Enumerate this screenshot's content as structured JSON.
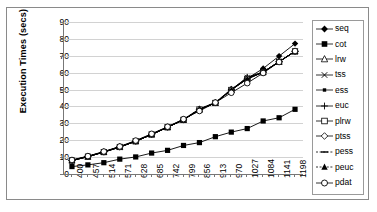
{
  "chart": {
    "ylabel": "Execution Times (secs)",
    "xlabel": "",
    "title": ""
  },
  "axis": {
    "y_ticks": [
      "90",
      "80",
      "70",
      "60",
      "50",
      "40",
      "30",
      "20",
      "10",
      "0"
    ],
    "x_ticks": [
      "400",
      "457",
      "514",
      "571",
      "628",
      "685",
      "742",
      "799",
      "856",
      "913",
      "970",
      "1027",
      "1084",
      "1141",
      "1198"
    ]
  },
  "legend": {
    "items": [
      {
        "label": "seq",
        "marker": "filled-diamond",
        "color": "#000000"
      },
      {
        "label": "cot",
        "marker": "filled-square",
        "color": "#000000"
      },
      {
        "label": "lrw",
        "marker": "open-triangle",
        "color": "#000000"
      },
      {
        "label": "tss",
        "marker": "cross-x",
        "color": "#000000"
      },
      {
        "label": "ess",
        "marker": "small-filled-square",
        "color": "#000000"
      },
      {
        "label": "euc",
        "marker": "plus",
        "color": "#000000"
      },
      {
        "label": "plrw",
        "marker": "open-square",
        "color": "#000000"
      },
      {
        "label": "ptss",
        "marker": "open-diamond",
        "color": "#000000"
      },
      {
        "label": "pess",
        "marker": "dash",
        "color": "#000000"
      },
      {
        "label": "peuc",
        "marker": "filled-triangle",
        "color": "#000000"
      },
      {
        "label": "pdat",
        "marker": "open-circle",
        "color": "#000000"
      }
    ]
  },
  "chart_data": {
    "type": "line",
    "title": "",
    "xlabel": "",
    "ylabel": "Execution Times (secs)",
    "ylim": [
      0,
      90
    ],
    "grid": true,
    "legend_position": "right",
    "categories": [
      "400",
      "457",
      "514",
      "571",
      "628",
      "685",
      "742",
      "799",
      "856",
      "913",
      "970",
      "1027",
      "1084",
      "1141",
      "1198"
    ],
    "series": [
      {
        "name": "seq",
        "marker": "filled-diamond",
        "values": [
          8.2,
          10.5,
          13.2,
          16.2,
          19.6,
          23.6,
          27.9,
          32.4,
          38.6,
          42.4,
          50.3,
          56.5,
          62.5,
          69.8,
          77.2
        ]
      },
      {
        "name": "cot",
        "marker": "filled-square",
        "values": [
          4.4,
          5.4,
          6.7,
          8.8,
          10.1,
          12.4,
          14.0,
          16.9,
          18.6,
          22.1,
          24.8,
          26.9,
          31.4,
          33.3,
          38.3
        ]
      },
      {
        "name": "lrw",
        "marker": "open-triangle",
        "values": [
          8.0,
          10.3,
          13.0,
          16.0,
          19.4,
          23.4,
          27.7,
          32.1,
          38.2,
          42.1,
          49.8,
          56.9,
          60.3,
          66.5,
          72.6
        ]
      },
      {
        "name": "tss",
        "marker": "cross-x",
        "values": [
          8.0,
          10.3,
          13.0,
          16.0,
          19.4,
          23.4,
          27.7,
          32.1,
          38.2,
          42.1,
          49.8,
          57.2,
          60.3,
          66.5,
          72.6
        ]
      },
      {
        "name": "ess",
        "marker": "small-filled-square",
        "values": [
          8.0,
          10.3,
          13.0,
          16.0,
          19.4,
          23.4,
          27.7,
          32.1,
          38.2,
          42.1,
          49.8,
          56.6,
          60.3,
          66.5,
          72.6
        ]
      },
      {
        "name": "euc",
        "marker": "plus",
        "values": [
          8.0,
          10.3,
          13.0,
          16.0,
          19.4,
          23.4,
          27.7,
          32.1,
          38.2,
          42.1,
          49.8,
          57.4,
          60.3,
          66.5,
          72.6
        ]
      },
      {
        "name": "plrw",
        "marker": "open-square",
        "values": [
          8.0,
          10.3,
          13.0,
          16.0,
          19.4,
          23.4,
          27.7,
          32.1,
          38.2,
          42.1,
          49.8,
          56.3,
          60.3,
          66.5,
          72.6
        ]
      },
      {
        "name": "ptss",
        "marker": "open-diamond",
        "values": [
          8.0,
          10.3,
          13.0,
          16.0,
          19.4,
          23.4,
          27.7,
          32.1,
          38.2,
          42.1,
          49.8,
          56.3,
          60.3,
          66.5,
          72.6
        ]
      },
      {
        "name": "pess",
        "marker": "dash",
        "values": [
          8.0,
          10.3,
          13.0,
          16.0,
          19.4,
          23.4,
          27.7,
          32.1,
          38.2,
          42.1,
          49.8,
          56.3,
          60.3,
          66.5,
          72.6
        ]
      },
      {
        "name": "peuc",
        "marker": "filled-triangle",
        "values": [
          8.0,
          10.3,
          13.0,
          16.0,
          19.4,
          23.4,
          27.7,
          32.1,
          38.2,
          42.1,
          49.8,
          56.3,
          60.3,
          66.5,
          72.6
        ]
      },
      {
        "name": "pdat",
        "marker": "open-circle",
        "values": [
          8.3,
          10.6,
          13.3,
          16.3,
          19.8,
          23.8,
          28.0,
          32.5,
          37.3,
          42.3,
          48.1,
          53.8,
          59.8,
          66.3,
          72.8
        ]
      }
    ]
  }
}
